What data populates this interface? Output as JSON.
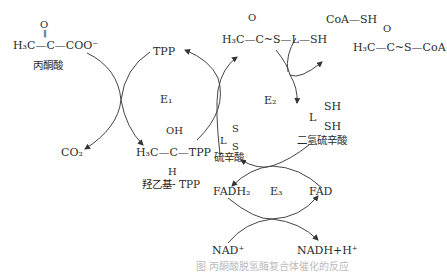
{
  "diagram": {
    "type": "metabolic-pathway",
    "nodes": {
      "pyruvate": {
        "struct_top": "O",
        "struct_main": "H₃C—C—COO⁻",
        "label": "丙酮酸"
      },
      "tpp": {
        "label": "TPP"
      },
      "co2": {
        "label": "CO₂"
      },
      "hydroxyethyl_tpp": {
        "struct_top": "OH",
        "struct_main": "H₃C—C—TPP",
        "struct_bottom": "H",
        "label": "羟乙基- TPP"
      },
      "acetyl_lipoamide": {
        "struct_top": "O",
        "struct_main": "H₃C—C~S—L—SH"
      },
      "coa_sh": {
        "label": "CoA—SH"
      },
      "acetyl_coa": {
        "struct_top": "O",
        "struct_main": "H₃C—C~S—CoA"
      },
      "dihydrolipoamide": {
        "sh1": "SH",
        "l": "L",
        "sh2": "SH",
        "label": "二氢硫辛酸"
      },
      "lipoamide": {
        "s1": "S",
        "l": "L",
        "s2": "S",
        "label": "硫辛酸"
      },
      "fadh2": {
        "label": "FADH₂"
      },
      "fad": {
        "label": "FAD"
      },
      "nad": {
        "label": "NAD⁺"
      },
      "nadh": {
        "label": "NADH+H⁺"
      }
    },
    "enzymes": {
      "e1": "E₁",
      "e2": "E₂",
      "e3": "E₃"
    },
    "caption": "图  丙酮酸脱氢酶复合体催化的反应"
  }
}
